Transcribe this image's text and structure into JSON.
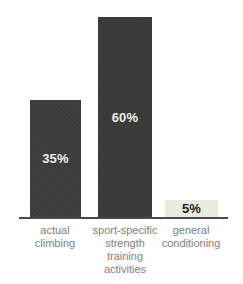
{
  "chart_data": {
    "type": "bar",
    "title": "",
    "xlabel": "",
    "ylabel": "",
    "ylim": [
      0,
      65
    ],
    "unit": "%",
    "grid": false,
    "legend": false,
    "px_per_percent": 3.33,
    "axis_color": "#4a4a4a",
    "category_label_color": "#7e7e7e",
    "background": "#ffffff",
    "categories": [
      "actual\nclimbing",
      "sport-specific\nstrength\ntraining\nactivities",
      "general\nconditioning"
    ],
    "values": [
      35,
      60,
      5
    ],
    "bars": [
      {
        "category": "actual\nclimbing",
        "value": 35,
        "value_label": "35%",
        "bar_color": "#3b3b3b",
        "text_color": "#ececec"
      },
      {
        "category": "sport-specific\nstrength\ntraining\nactivities",
        "value": 60,
        "value_label": "60%",
        "bar_color": "#393939",
        "text_color": "#ececec"
      },
      {
        "category": "general\nconditioning",
        "value": 5,
        "value_label": "5%",
        "bar_color": "#ece9e0",
        "text_color": "#1f1f1f"
      }
    ]
  }
}
